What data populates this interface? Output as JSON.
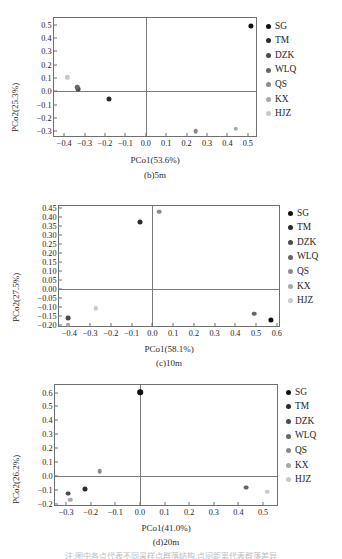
{
  "figure": {
    "footnote": "注:图中各点代表不同采样点群落结构,点间距离代表群落差异"
  },
  "legend": {
    "items": [
      {
        "label": "SG",
        "color": "#111111"
      },
      {
        "label": "TM",
        "color": "#2b2b2b"
      },
      {
        "label": "DZK",
        "color": "#4a4a4a"
      },
      {
        "label": "WLQ",
        "color": "#666666"
      },
      {
        "label": "QS",
        "color": "#8a8a8a"
      },
      {
        "label": "KX",
        "color": "#a8a8a8"
      },
      {
        "label": "HJZ",
        "color": "#c9c9c9"
      }
    ]
  },
  "chart_data": [
    {
      "type": "scatter",
      "id": "panel-b-5m",
      "title": "(b)5m",
      "xlabel": "PCo1(53.6%)",
      "ylabel": "PCo2(25.3%)",
      "xlim": [
        -0.45,
        0.55
      ],
      "ylim": [
        -0.35,
        0.55
      ],
      "xticks": [
        -0.4,
        -0.3,
        -0.2,
        -0.1,
        0.0,
        0.1,
        0.2,
        0.3,
        0.4,
        0.5
      ],
      "xticklabels": [
        "−0.4",
        "−0.3",
        "−0.2",
        "−0.1",
        "0.0",
        "0.1",
        "0.2",
        "0.3",
        "0.4",
        "0.5"
      ],
      "yticks": [
        -0.3,
        -0.2,
        -0.1,
        0.0,
        0.1,
        0.2,
        0.3,
        0.4,
        0.5
      ],
      "yticklabels": [
        "−0.3",
        "−0.2",
        "−0.1",
        "0.0",
        "0.1",
        "0.2",
        "0.3",
        "0.4",
        "0.5"
      ],
      "grid": false,
      "legend_position": "right",
      "points": [
        {
          "name": "SG",
          "x": 0.515,
          "y": 0.492,
          "color": "#111111",
          "size": 5.2
        },
        {
          "name": "TM",
          "x": -0.182,
          "y": -0.058,
          "color": "#2b2b2b",
          "size": 5.0
        },
        {
          "name": "DZK",
          "x": -0.332,
          "y": 0.018,
          "color": "#4a4a4a",
          "size": 4.8
        },
        {
          "name": "WLQ",
          "x": -0.336,
          "y": 0.03,
          "color": "#666666",
          "size": 4.6
        },
        {
          "name": "QS",
          "x": 0.245,
          "y": -0.3,
          "color": "#8a8a8a",
          "size": 4.6
        },
        {
          "name": "KX",
          "x": 0.442,
          "y": -0.28,
          "color": "#a8a8a8",
          "size": 4.4
        },
        {
          "name": "HJZ",
          "x": -0.385,
          "y": 0.105,
          "color": "#c9c9c9",
          "size": 4.4
        }
      ]
    },
    {
      "type": "scatter",
      "id": "panel-c-10m",
      "title": "(c)10m",
      "xlabel": "PCo1(58.1%)",
      "ylabel": "PCo2(27.5%)",
      "xlim": [
        -0.45,
        0.62
      ],
      "ylim": [
        -0.215,
        0.46
      ],
      "xticks": [
        -0.4,
        -0.3,
        -0.2,
        -0.1,
        0.0,
        0.1,
        0.2,
        0.3,
        0.4,
        0.5,
        0.6
      ],
      "xticklabels": [
        "−0.4",
        "−0.3",
        "−0.2",
        "−0.1",
        "0.0",
        "0.1",
        "0.2",
        "0.3",
        "0.4",
        "0.5",
        "0.6"
      ],
      "yticks": [
        -0.2,
        -0.15,
        -0.1,
        -0.05,
        0.0,
        0.05,
        0.1,
        0.15,
        0.2,
        0.25,
        0.3,
        0.35,
        0.4,
        0.45
      ],
      "yticklabels": [
        "−0.20",
        "−0.15",
        "−0.10",
        "−0.05",
        "0.00",
        "0.05",
        "0.10",
        "0.15",
        "0.20",
        "0.25",
        "0.30",
        "0.35",
        "0.40",
        "0.45"
      ],
      "grid": false,
      "legend_position": "right",
      "points": [
        {
          "name": "SG",
          "x": 0.57,
          "y": -0.168,
          "color": "#111111",
          "size": 5.2
        },
        {
          "name": "TM",
          "x": -0.062,
          "y": 0.372,
          "color": "#2b2b2b",
          "size": 5.0
        },
        {
          "name": "DZK",
          "x": -0.405,
          "y": -0.162,
          "color": "#4a4a4a",
          "size": 4.8
        },
        {
          "name": "WLQ",
          "x": 0.49,
          "y": -0.136,
          "color": "#666666",
          "size": 4.6
        },
        {
          "name": "QS",
          "x": 0.032,
          "y": 0.428,
          "color": "#8a8a8a",
          "size": 4.6
        },
        {
          "name": "KX",
          "x": -0.408,
          "y": -0.198,
          "color": "#a8a8a8",
          "size": 4.4
        },
        {
          "name": "HJZ",
          "x": -0.272,
          "y": -0.107,
          "color": "#c9c9c9",
          "size": 4.4
        }
      ]
    },
    {
      "type": "scatter",
      "id": "panel-d-20m",
      "title": "(d)20m",
      "xlabel": "PCo1(41.0%)",
      "ylabel": "PCo2(26.2%)",
      "xlim": [
        -0.345,
        0.565
      ],
      "ylim": [
        -0.225,
        0.655
      ],
      "xticks": [
        -0.3,
        -0.2,
        -0.1,
        0.0,
        0.1,
        0.2,
        0.3,
        0.4,
        0.5
      ],
      "xticklabels": [
        "−0.3",
        "−0.2",
        "−0.1",
        "0.0",
        "0.1",
        "0.2",
        "0.3",
        "0.4",
        "0.5"
      ],
      "yticks": [
        -0.2,
        -0.1,
        0.0,
        0.1,
        0.2,
        0.3,
        0.4,
        0.5,
        0.6
      ],
      "yticklabels": [
        "−0.2",
        "−0.1",
        "0.0",
        "0.1",
        "0.2",
        "0.3",
        "0.4",
        "0.5",
        "0.6"
      ],
      "grid": false,
      "legend_position": "right",
      "points": [
        {
          "name": "SG",
          "x": 0.0,
          "y": 0.605,
          "color": "#111111",
          "size": 5.6
        },
        {
          "name": "TM",
          "x": -0.222,
          "y": -0.095,
          "color": "#2b2b2b",
          "size": 5.0
        },
        {
          "name": "DZK",
          "x": -0.292,
          "y": -0.128,
          "color": "#4a4a4a",
          "size": 4.8
        },
        {
          "name": "WLQ",
          "x": 0.43,
          "y": -0.085,
          "color": "#666666",
          "size": 4.8
        },
        {
          "name": "QS",
          "x": -0.163,
          "y": 0.033,
          "color": "#8a8a8a",
          "size": 4.6
        },
        {
          "name": "KX",
          "x": -0.283,
          "y": -0.175,
          "color": "#a8a8a8",
          "size": 4.4
        },
        {
          "name": "HJZ",
          "x": 0.518,
          "y": -0.117,
          "color": "#c9c9c9",
          "size": 4.4
        }
      ]
    }
  ]
}
